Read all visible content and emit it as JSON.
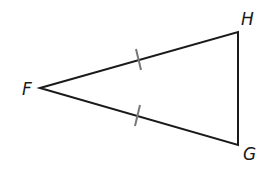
{
  "diagram": {
    "type": "triangle",
    "vertices": {
      "F": {
        "label": "F",
        "x": 40,
        "y": 88
      },
      "H": {
        "label": "H",
        "x": 238,
        "y": 32
      },
      "G": {
        "label": "G",
        "x": 238,
        "y": 145
      }
    },
    "sides": [
      {
        "from": "F",
        "to": "H",
        "tick_marks": 1
      },
      {
        "from": "F",
        "to": "G",
        "tick_marks": 1
      },
      {
        "from": "H",
        "to": "G",
        "tick_marks": 0
      }
    ],
    "annotation": "FH ≅ FG (isosceles triangle)",
    "colors": {
      "line": "#1a1a1a",
      "tick": "#777777"
    }
  }
}
